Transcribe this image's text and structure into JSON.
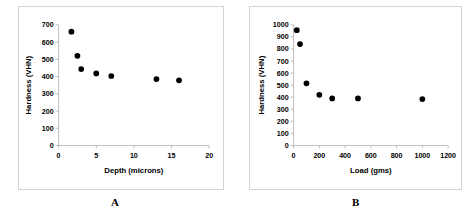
{
  "figure": {
    "panels": [
      {
        "caption": "A",
        "chart_data": {
          "type": "scatter",
          "title": "",
          "xlabel": "Depth (microns)",
          "ylabel": "Hardness (VHN)",
          "xlim": [
            0,
            20
          ],
          "ylim": [
            0,
            700
          ],
          "xticks": [
            0,
            5,
            10,
            15,
            20
          ],
          "xtick_labels": [
            "0",
            "5",
            "10",
            "15",
            "20"
          ],
          "yticks": [
            0,
            100,
            200,
            300,
            400,
            500,
            600,
            700
          ],
          "ytick_labels": [
            "0",
            "100",
            "200",
            "300",
            "400",
            "500",
            "600",
            "700"
          ],
          "grid": false,
          "legend": "none",
          "marker": "filled-circle",
          "marker_color": "#000000",
          "x": [
            1.7,
            2.5,
            3.0,
            5.0,
            7.0,
            13.0,
            16.0
          ],
          "y": [
            660,
            520,
            443,
            418,
            403,
            385,
            378
          ]
        }
      },
      {
        "caption": "B",
        "chart_data": {
          "type": "scatter",
          "title": "",
          "xlabel": "Load (gms)",
          "ylabel": "Hardness (VHN)",
          "xlim": [
            0,
            1200
          ],
          "ylim": [
            0,
            1000
          ],
          "xticks": [
            0,
            200,
            400,
            600,
            800,
            1000,
            1200
          ],
          "xtick_labels": [
            "0",
            "200",
            "400",
            "600",
            "800",
            "1000",
            "1200"
          ],
          "yticks": [
            0,
            100,
            200,
            300,
            400,
            500,
            600,
            700,
            800,
            900,
            1000
          ],
          "ytick_labels": [
            "0",
            "100",
            "200",
            "300",
            "400",
            "500",
            "600",
            "700",
            "800",
            "900",
            "1000"
          ],
          "grid": false,
          "legend": "none",
          "marker": "filled-circle",
          "marker_color": "#000000",
          "x": [
            25,
            50,
            100,
            200,
            300,
            500,
            1000
          ],
          "y": [
            955,
            840,
            515,
            420,
            390,
            390,
            385
          ]
        }
      }
    ]
  },
  "chart_data": [
    {
      "type": "scatter",
      "title": "",
      "xlabel": "Depth (microns)",
      "ylabel": "Hardness (VHN)",
      "xlim": [
        0,
        20
      ],
      "ylim": [
        0,
        700
      ],
      "x": [
        1.7,
        2.5,
        3.0,
        5.0,
        7.0,
        13.0,
        16.0
      ],
      "y": [
        660,
        520,
        443,
        418,
        403,
        385,
        378
      ]
    },
    {
      "type": "scatter",
      "title": "",
      "xlabel": "Load (gms)",
      "ylabel": "Hardness (VHN)",
      "xlim": [
        0,
        1200
      ],
      "ylim": [
        0,
        1000
      ],
      "x": [
        25,
        50,
        100,
        200,
        300,
        500,
        1000
      ],
      "y": [
        955,
        840,
        515,
        420,
        390,
        390,
        385
      ]
    }
  ]
}
